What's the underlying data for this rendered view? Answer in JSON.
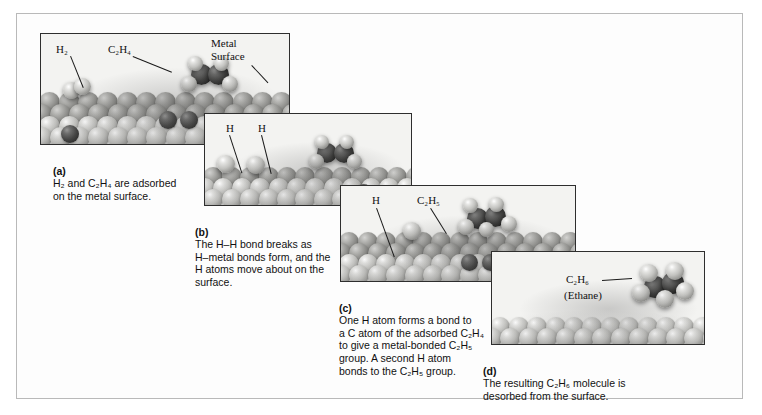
{
  "figure": {
    "panel_count": 4
  },
  "panels": [
    {
      "key": "a",
      "tag": "(a)",
      "caption": "H2 and C2H4 are adsorbed on the metal surface.",
      "caption_lines": [
        "H₂ and C₂H₄ are adsorbed",
        "on the metal surface."
      ],
      "labels": [
        {
          "name": "label-h2",
          "text": "H₂"
        },
        {
          "name": "label-c2h4",
          "text": "C₂H₄"
        },
        {
          "name": "label-metal-surface",
          "text": "Metal\nSurface"
        }
      ]
    },
    {
      "key": "b",
      "tag": "(b)",
      "caption": "The H–H bond breaks as H–metal bonds form, and the H atoms move about on the surface.",
      "caption_lines": [
        "The H–H bond breaks as",
        "H–metal bonds form, and the",
        "H atoms move about on the",
        "surface."
      ],
      "labels": [
        {
          "name": "label-h-left",
          "text": "H"
        },
        {
          "name": "label-h-right",
          "text": "H"
        }
      ]
    },
    {
      "key": "c",
      "tag": "(c)",
      "caption": "One H atom forms a bond to a C atom of the adsorbed C2H4 to give a metal-bonded C2H5 group. A second H atom bonds to the C2H5 group.",
      "caption_lines": [
        "One H atom forms a bond to",
        "a C atom of the adsorbed C₂H₄",
        "to give a metal-bonded C₂H₅",
        "group. A second H atom",
        "bonds to the C₂H₅ group."
      ],
      "labels": [
        {
          "name": "label-h",
          "text": "H"
        },
        {
          "name": "label-c2h5",
          "text": "C₂H₅"
        }
      ]
    },
    {
      "key": "d",
      "tag": "(d)",
      "caption": "The resulting C2H6 molecule is desorbed from the surface.",
      "caption_lines": [
        "The resulting C₂H₆ molecule is",
        "desorbed from the surface."
      ],
      "labels": [
        {
          "name": "label-c2h6",
          "text": "C₂H₆"
        },
        {
          "name": "label-ethane",
          "text": "(Ethane)"
        }
      ]
    }
  ],
  "colors": {
    "page_background": "#ffffff",
    "frame_border": "#b9b9b9",
    "panel_border": "#2e2e2e",
    "metal_atom": "#c2c2bf",
    "carbon_atom": "#3c3c3b",
    "hydrogen_atom": "#e4e4e2",
    "text": "#111111"
  }
}
